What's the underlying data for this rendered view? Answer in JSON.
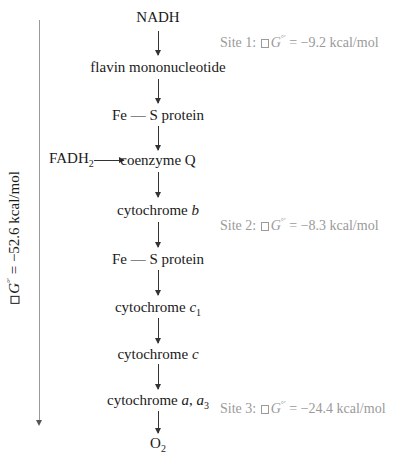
{
  "diagram": {
    "nodes": [
      {
        "id": "nadh",
        "label": "NADH"
      },
      {
        "id": "fmn",
        "label": "flavin mononucleotide"
      },
      {
        "id": "fes1",
        "label": "Fe — S protein"
      },
      {
        "id": "coq",
        "label": "coenzyme Q"
      },
      {
        "id": "cytb",
        "label_main": "cytochrome ",
        "label_ital": "b"
      },
      {
        "id": "fes2",
        "label": "Fe — S protein"
      },
      {
        "id": "cytc1",
        "label_main": "cytochrome ",
        "label_ital": "c",
        "label_sub": "1"
      },
      {
        "id": "cytc",
        "label_main": "cytochrome ",
        "label_ital": "c"
      },
      {
        "id": "cytaa3",
        "label_main": "cytochrome ",
        "label_ital": "a",
        "label_sep": ", ",
        "label_ital2": "a",
        "label_sub": "3"
      },
      {
        "id": "o2",
        "label_main": "O",
        "label_sub": "2"
      }
    ],
    "side_input": {
      "label_main": "FADH",
      "label_sub": "2",
      "target": "coenzyme Q"
    },
    "sites": [
      {
        "prefix": "Site 1: ",
        "symbol": "G",
        "sup": "°′",
        "eq": " =  ",
        "value": "−9.2 kcal/mol"
      },
      {
        "prefix": "Site 2: ",
        "symbol": "G",
        "sup": "°′",
        "eq": " =  ",
        "value": "−8.3 kcal/mol"
      },
      {
        "prefix": "Site 3: ",
        "symbol": "G",
        "sup": "°′",
        "eq": " = ",
        "value": "−24.4 kcal/mol"
      }
    ],
    "total": {
      "symbol": "G",
      "sup": "°′",
      "eq": " = ",
      "value": "−52.6 kcal/mol"
    }
  }
}
